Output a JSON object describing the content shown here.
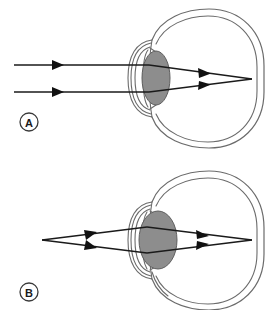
{
  "figure": {
    "width": 278,
    "height": 310,
    "background_color": "#ffffff"
  },
  "colors": {
    "outline": "#6b6b6b",
    "lens_fill": "#8d8d8d",
    "lens_stroke": "#5e5e5e",
    "ray": "#1a1a1a",
    "label_text": "#1a1a1a",
    "label_ring": "#3a3a3a"
  },
  "panels": [
    {
      "id": "panel-a",
      "label": "A",
      "label_position": {
        "x": 29,
        "y": 122
      },
      "caption": "Distant object: parallel light rays, flattened lens, focus on retina",
      "light_source": "distant",
      "ray_geometry": "parallel",
      "lens_shape": "flattened",
      "lens_center": {
        "x": 156,
        "y": 78
      },
      "lens_rx": 14,
      "lens_ry": 27,
      "focal_point": {
        "x": 252,
        "y": 79
      },
      "rays": [
        {
          "name": "upper-ray",
          "incoming_start": {
            "x": 14,
            "y": 65
          },
          "lens_entry": {
            "x": 148,
            "y": 65
          },
          "focus_end": {
            "x": 252,
            "y": 79
          },
          "arrow_positions": [
            {
              "x": 58,
              "y": 65
            },
            {
              "x": 205,
              "y": 73
            }
          ]
        },
        {
          "name": "lower-ray",
          "incoming_start": {
            "x": 14,
            "y": 92
          },
          "lens_entry": {
            "x": 148,
            "y": 92
          },
          "focus_end": {
            "x": 252,
            "y": 79
          },
          "arrow_positions": [
            {
              "x": 58,
              "y": 92
            },
            {
              "x": 205,
              "y": 85
            }
          ]
        }
      ]
    },
    {
      "id": "panel-b",
      "label": "B",
      "label_position": {
        "x": 29,
        "y": 292
      },
      "caption": "Near object: diverging light rays, rounded lens, focus on retina",
      "light_source": "near-point",
      "ray_geometry": "diverging",
      "lens_shape": "rounded",
      "lens_center": {
        "x": 158,
        "y": 240
      },
      "lens_rx": 19,
      "lens_ry": 29,
      "source_point": {
        "x": 42,
        "y": 240
      },
      "focal_point": {
        "x": 252,
        "y": 240
      },
      "rays": [
        {
          "name": "upper-ray",
          "source": {
            "x": 42,
            "y": 240
          },
          "lens_entry": {
            "x": 147,
            "y": 227
          },
          "focus_end": {
            "x": 252,
            "y": 240
          },
          "arrow_positions": [
            {
              "x": 92,
              "y": 234
            },
            {
              "x": 203,
              "y": 234
            }
          ]
        },
        {
          "name": "lower-ray",
          "source": {
            "x": 42,
            "y": 240
          },
          "lens_entry": {
            "x": 147,
            "y": 253
          },
          "focus_end": {
            "x": 252,
            "y": 240
          },
          "arrow_positions": [
            {
              "x": 92,
              "y": 246
            },
            {
              "x": 203,
              "y": 246
            }
          ]
        }
      ]
    }
  ]
}
